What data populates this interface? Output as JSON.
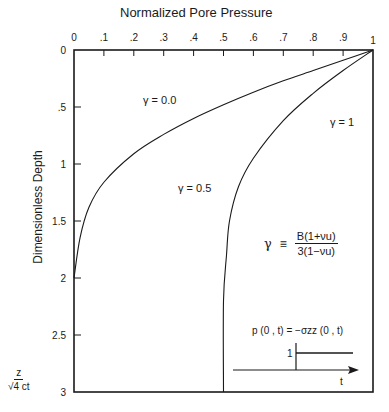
{
  "chart_data": {
    "type": "line",
    "title": "Normalized Pore Pressure",
    "xlabel": "Normalized Pore Pressure",
    "ylabel": "Dimensionless Depth",
    "y_unit_label": {
      "numerator": "z",
      "denominator": "√4 ct"
    },
    "xlim": [
      0,
      1
    ],
    "ylim": [
      3,
      0
    ],
    "x_axis_position": "top",
    "y_inverted": true,
    "grid": false,
    "x_ticks": [
      "0",
      ".1",
      ".2",
      ".3",
      ".4",
      ".5",
      ".6",
      ".7",
      ".8",
      ".9",
      "1"
    ],
    "y_ticks": [
      "0",
      ".5",
      "1",
      "1.5",
      "2",
      "2.5",
      "3"
    ],
    "series": [
      {
        "name": "γ = 0.0",
        "x": [
          1.0,
          0.9,
          0.8,
          0.7,
          0.6,
          0.5,
          0.4,
          0.3,
          0.2,
          0.1,
          0.05,
          0.02,
          0.0
        ],
        "y": [
          0.0,
          0.09,
          0.18,
          0.27,
          0.37,
          0.48,
          0.6,
          0.74,
          0.91,
          1.16,
          1.38,
          1.65,
          2.0
        ]
      },
      {
        "name": "γ = 0.5",
        "x": [
          1.0,
          0.9,
          0.8,
          0.7,
          0.6,
          0.55,
          0.52,
          0.51,
          0.5,
          0.5
        ],
        "y": [
          0.0,
          0.18,
          0.38,
          0.62,
          0.95,
          1.2,
          1.5,
          1.8,
          2.2,
          3.0
        ]
      },
      {
        "name": "γ = 1",
        "x": [
          1.0,
          1.0
        ],
        "y": [
          0.0,
          3.0
        ]
      }
    ],
    "annotations": [
      "γ = 0.0",
      "γ = 0.5",
      "γ = 1",
      "γ ≡ B(1+νu) / 3(1−νu)",
      "p(0, t) = −σzz(0, t)",
      "1",
      "t"
    ]
  },
  "labels": {
    "title": "Normalized Pore Pressure",
    "ylabel": "Dimensionless Depth",
    "x_ticks": [
      "0",
      ".1",
      ".2",
      ".3",
      ".4",
      ".5",
      ".6",
      ".7",
      ".8",
      ".9",
      "1"
    ],
    "y_ticks": [
      "0",
      ".5",
      "1",
      "1.5",
      "2",
      "2.5",
      "3"
    ],
    "unit_num": "z",
    "unit_den": "√4 ct",
    "curve_g0": "γ = 0.0",
    "curve_g05": "γ = 0.5",
    "curve_g1": "γ = 1",
    "def_gamma": "γ",
    "def_equiv": "≡",
    "def_num": "B(1+νu)",
    "def_den": "3(1−νu)",
    "inset_eq": "p (0 , t) = −σzz (0 , t)",
    "inset_step": "1",
    "inset_t": "t"
  }
}
